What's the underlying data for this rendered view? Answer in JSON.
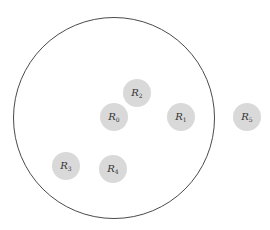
{
  "diagram": {
    "boundary": {
      "cx": 114,
      "cy": 118,
      "r": 101,
      "stroke": "#4a4a4a"
    },
    "node_fill": "#d9d9d9",
    "nodes": [
      {
        "id": "R0",
        "base": "R",
        "sub": "0",
        "cx": 114,
        "cy": 117,
        "r": 14
      },
      {
        "id": "R1",
        "base": "R",
        "sub": "1",
        "cx": 181,
        "cy": 117,
        "r": 14
      },
      {
        "id": "R2",
        "base": "R",
        "sub": "2",
        "cx": 137,
        "cy": 93,
        "r": 14
      },
      {
        "id": "R3",
        "base": "R",
        "sub": "3",
        "cx": 66,
        "cy": 166,
        "r": 14
      },
      {
        "id": "R4",
        "base": "R",
        "sub": "4",
        "cx": 113,
        "cy": 169,
        "r": 14
      },
      {
        "id": "R5",
        "base": "R",
        "sub": "5",
        "cx": 247,
        "cy": 117,
        "r": 14
      }
    ]
  }
}
